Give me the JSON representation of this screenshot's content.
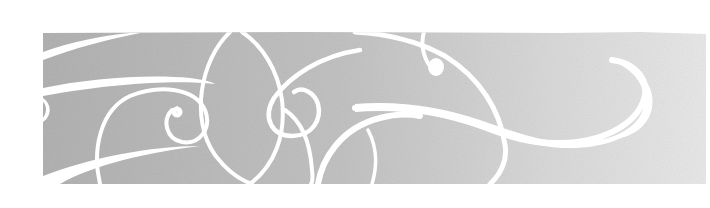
{
  "banner": {
    "description": "Decorative gray gradient band with white calligraphic swirl ornaments",
    "colors": {
      "page_background": "#ffffff",
      "band_left": "#b2b2b2",
      "band_mid": "#c4c4c4",
      "band_right": "#e6e6e6",
      "swirl": "#ffffff"
    },
    "band": {
      "x": 43,
      "y": 32,
      "width": 667,
      "height": 152
    }
  }
}
